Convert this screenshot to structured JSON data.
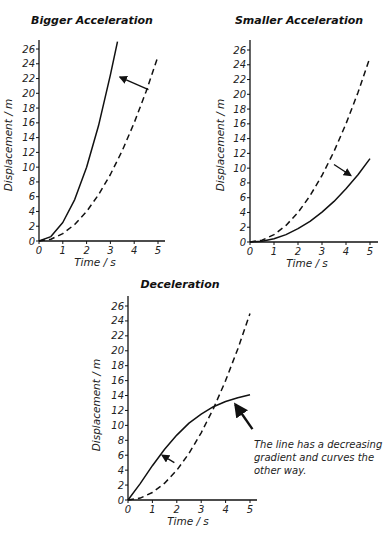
{
  "chart_data": [
    {
      "type": "line",
      "title": "Bigger Acceleration",
      "xlabel": "Time / s",
      "ylabel": "Displacement / m",
      "xlim": [
        0,
        5
      ],
      "ylim": [
        0,
        27
      ],
      "xticks": [
        "0",
        "1",
        "2",
        "3",
        "4",
        "5"
      ],
      "yticks": [
        "0",
        "2",
        "4",
        "6",
        "8",
        "10",
        "12",
        "14",
        "16",
        "18",
        "20",
        "22",
        "24",
        "26"
      ],
      "grid": false,
      "series": [
        {
          "name": "reference (dashed)",
          "style": "dashed",
          "x": [
            0,
            0.5,
            1,
            1.5,
            2,
            2.5,
            3,
            3.5,
            4,
            4.5,
            5
          ],
          "y": [
            0,
            0.25,
            1,
            2.25,
            4,
            6.25,
            9,
            12.25,
            16,
            20.25,
            25
          ]
        },
        {
          "name": "bigger acceleration (solid)",
          "style": "solid",
          "x": [
            0,
            0.5,
            1,
            1.5,
            2,
            2.5,
            3,
            3.3
          ],
          "y": [
            0,
            0.6,
            2.5,
            5.6,
            10,
            15.6,
            22.5,
            27
          ]
        }
      ],
      "annotations": [
        {
          "type": "arrow",
          "from": [
            4.6,
            20.5
          ],
          "to": [
            3.4,
            22.2
          ],
          "meaning": "curve moves to steeper"
        }
      ]
    },
    {
      "type": "line",
      "title": "Smaller Acceleration",
      "xlabel": "Time / s",
      "ylabel": "Displacement / m",
      "xlim": [
        0,
        5
      ],
      "ylim": [
        0,
        27
      ],
      "xticks": [
        "0",
        "1",
        "2",
        "3",
        "4",
        "5"
      ],
      "yticks": [
        "0",
        "2",
        "4",
        "6",
        "8",
        "10",
        "12",
        "14",
        "16",
        "18",
        "20",
        "22",
        "24",
        "26"
      ],
      "grid": false,
      "series": [
        {
          "name": "reference (dashed)",
          "style": "dashed",
          "x": [
            0,
            0.5,
            1,
            1.5,
            2,
            2.5,
            3,
            3.5,
            4,
            4.5,
            5
          ],
          "y": [
            0,
            0.25,
            1,
            2.25,
            4,
            6.25,
            9,
            12.25,
            16,
            20.25,
            25
          ]
        },
        {
          "name": "smaller acceleration (solid)",
          "style": "solid",
          "x": [
            0,
            0.5,
            1,
            1.5,
            2,
            2.5,
            3,
            3.5,
            4,
            4.5,
            5
          ],
          "y": [
            0,
            0.11,
            0.45,
            1,
            1.8,
            2.8,
            4.05,
            5.5,
            7.2,
            9.1,
            11.3
          ]
        }
      ],
      "annotations": [
        {
          "type": "arrow",
          "from": [
            3.5,
            10.5
          ],
          "to": [
            4.2,
            9
          ],
          "meaning": "curve moves to shallower"
        }
      ]
    },
    {
      "type": "line",
      "title": "Deceleration",
      "xlabel": "Time / s",
      "ylabel": "Displacement / m",
      "xlim": [
        0,
        5
      ],
      "ylim": [
        0,
        27
      ],
      "xticks": [
        "0",
        "1",
        "2",
        "3",
        "4",
        "5"
      ],
      "yticks": [
        "0",
        "2",
        "4",
        "6",
        "8",
        "10",
        "12",
        "14",
        "16",
        "18",
        "20",
        "22",
        "24",
        "26"
      ],
      "grid": false,
      "series": [
        {
          "name": "reference (dashed)",
          "style": "dashed",
          "x": [
            0,
            0.5,
            1,
            1.5,
            2,
            2.5,
            3,
            3.5,
            4,
            4.5,
            5
          ],
          "y": [
            0,
            0.25,
            1,
            2.25,
            4,
            6.25,
            9,
            12.25,
            16,
            20.25,
            25
          ]
        },
        {
          "name": "deceleration (solid)",
          "style": "solid",
          "x": [
            0,
            0.5,
            1,
            1.5,
            2,
            2.5,
            3,
            3.5,
            4,
            4.5,
            5
          ],
          "y": [
            0,
            2.2,
            4.6,
            6.8,
            8.7,
            10.3,
            11.5,
            12.5,
            13.2,
            13.7,
            14.1
          ]
        }
      ],
      "annotations": [
        {
          "type": "arrow",
          "from": [
            1.9,
            5
          ],
          "to": [
            1.4,
            6
          ]
        },
        {
          "type": "arrow",
          "from": [
            5.1,
            9.5
          ],
          "to": [
            4.4,
            12.8
          ],
          "text": "The line has a decreasing gradient and curves the other way."
        }
      ]
    }
  ],
  "charts": [
    {
      "title": "Bigger Acceleration",
      "xlabel": "Time / s",
      "ylabel": "Displacement / m"
    },
    {
      "title": "Smaller Acceleration",
      "xlabel": "Time / s",
      "ylabel": "Displacement / m"
    },
    {
      "title": "Deceleration",
      "xlabel": "Time / s",
      "ylabel": "Displacement / m",
      "note_lines": [
        "The line has a decreasing",
        "gradient and curves the",
        "other way."
      ]
    }
  ]
}
